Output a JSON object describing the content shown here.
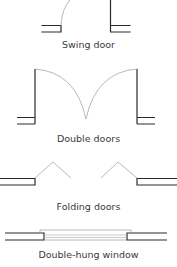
{
  "diagram": {
    "colors": {
      "wall": "#2b2b2b",
      "arc": "#9a9a9a",
      "glass": "#b5b5b5",
      "text": "#3a3a3a"
    },
    "symbols": [
      {
        "id": "swing-door",
        "label": "Swing door"
      },
      {
        "id": "double-doors",
        "label": "Double doors"
      },
      {
        "id": "folding-doors",
        "label": "Folding doors"
      },
      {
        "id": "double-hung-window",
        "label": "Double-hung window"
      }
    ]
  }
}
